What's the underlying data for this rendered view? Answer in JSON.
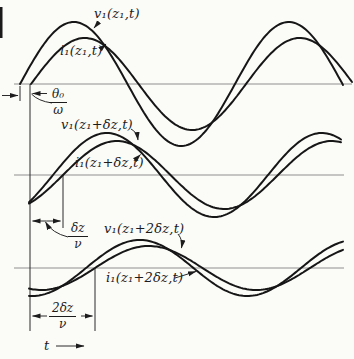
{
  "figure": {
    "bg_color": "#fbfbf8",
    "curve_color": "#161616",
    "axis_color": "#8f8f8f",
    "annotation_color": "#2a2a2a",
    "text_color": "#1c1c1c"
  },
  "waveform": {
    "type": "line",
    "period_px": 215,
    "sections": [
      {
        "id": "z1",
        "axis": {
          "y": 84,
          "x1": 14,
          "x2": 352
        },
        "series": [
          {
            "id": "v1-z1",
            "label": "v₁(z₁,t)",
            "x_start": 20,
            "x_end": 343,
            "zero_cross_x": 20,
            "amplitude": 62
          },
          {
            "id": "i1-z1",
            "label": "i₁(z₁,t)",
            "x_start": 31,
            "x_end": 352,
            "zero_cross_x": 31,
            "amplitude": 46
          }
        ]
      },
      {
        "id": "z1-plus-dz",
        "axis": {
          "y": 175,
          "x1": 14,
          "x2": 344
        },
        "series": [
          {
            "id": "v1-z1dz",
            "label": "v₁(z₁+δz,t)",
            "x_start": 29,
            "x_end": 341,
            "zero_cross_x": 53,
            "amplitude": 42
          },
          {
            "id": "i1-z1dz",
            "label": "i₁(z₁+δz,t)",
            "x_start": 29,
            "x_end": 341,
            "zero_cross_x": 63,
            "amplitude": 34
          }
        ]
      },
      {
        "id": "z1-plus-2dz",
        "axis": {
          "y": 268,
          "x1": 14,
          "x2": 344
        },
        "series": [
          {
            "id": "v1-z12dz",
            "label": "v₁(z₁+2δz,t)",
            "x_start": 29,
            "x_end": 343,
            "zero_cross_x": 86,
            "amplitude": 28
          },
          {
            "id": "i1-z12dz",
            "label": "i₁(z₁+2δz,t)",
            "x_start": 29,
            "x_end": 343,
            "zero_cross_x": 95,
            "amplitude": 22
          }
        ]
      }
    ]
  },
  "annotations": {
    "theta_delay": {
      "numerator": "θ₀",
      "denominator": "ω"
    },
    "dz_delay": {
      "numerator": "δz",
      "denominator": "ν"
    },
    "two_dz_delay": {
      "numerator": "2δz",
      "denominator": "ν"
    },
    "time_axis_label": "t"
  }
}
